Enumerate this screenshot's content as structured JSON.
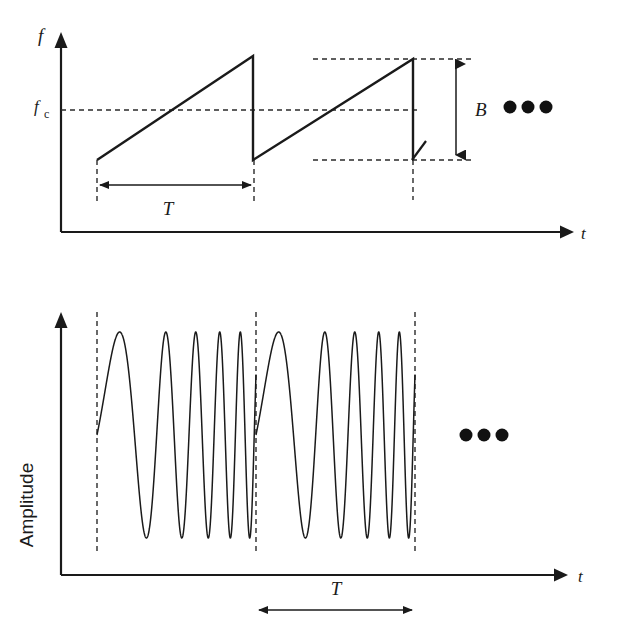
{
  "figure": {
    "ellipsis_glyph": "•••"
  },
  "panels": [
    {
      "id": "frequency",
      "name": "instantaneous-frequency-plot",
      "y_axis_label": "f",
      "x_axis_label": "t",
      "tick_label_base": "f",
      "tick_label_sub": "c",
      "period_label": "T",
      "bandwidth_label": "B",
      "continuation": "•••"
    },
    {
      "id": "amplitude",
      "name": "transmitted-waveform-plot",
      "y_axis_label": "Amplitude",
      "x_axis_label": "t",
      "period_label": "T",
      "continuation": "•••"
    }
  ],
  "colors": {
    "ink": "#1a1a1a",
    "dash": "#2a2a2a",
    "background": "#ffffff"
  },
  "chart_data": [
    {
      "type": "line",
      "name": "instantaneous-frequency",
      "title": "",
      "xlabel": "t",
      "ylabel": "f",
      "grid": false,
      "legend": "none",
      "annotations": [
        {
          "label": "f_c",
          "kind": "y-reference-line",
          "value": "fc"
        },
        {
          "label": "T",
          "kind": "horizontal-dimension",
          "span": "one sweep period"
        },
        {
          "label": "B",
          "kind": "vertical-dimension",
          "span": "sweep bandwidth"
        },
        {
          "label": "•••",
          "kind": "continuation"
        }
      ],
      "series": [
        {
          "name": "sawtooth-sweep",
          "description": "Linear up-chirp sawtooth, two periods shown, centered on fc, peak-to-peak bandwidth B",
          "points": [
            [
              0.0,
              -0.5
            ],
            [
              1.0,
              0.5
            ],
            [
              1.0,
              -0.5
            ],
            [
              2.0,
              0.5
            ],
            [
              2.0,
              -0.5
            ]
          ],
          "x_unit": "T",
          "y_unit": "B"
        }
      ],
      "xlim": [
        0,
        3.1
      ],
      "ylim": [
        -0.9,
        0.9
      ]
    },
    {
      "type": "line",
      "name": "transmitted-waveform",
      "title": "",
      "xlabel": "t",
      "ylabel": "Amplitude",
      "grid": false,
      "legend": "none",
      "annotations": [
        {
          "label": "T",
          "kind": "horizontal-dimension",
          "span": "one sweep period"
        },
        {
          "label": "•••",
          "kind": "continuation"
        }
      ],
      "series": [
        {
          "name": "linear-frequency-chirp",
          "description": "Constant-amplitude sinusoid whose frequency sweeps linearly from f_min to f_max each period T, repeating twice",
          "f_start_cycles_per_period": 1.2,
          "f_end_cycles_per_period": 9.0,
          "periods_shown": 2,
          "amplitude": 1.0
        }
      ],
      "xlim": [
        0,
        3.1
      ],
      "ylim": [
        -1.2,
        1.2
      ]
    }
  ]
}
